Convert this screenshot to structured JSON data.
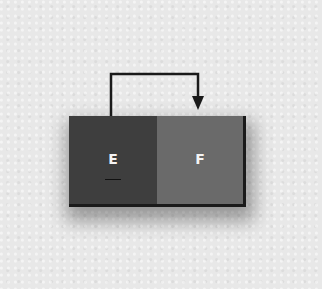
{
  "diagram": {
    "cells": [
      {
        "label": "E",
        "color": "#3e3e3e"
      },
      {
        "label": "F",
        "color": "#6a6a6a"
      }
    ],
    "arrow": {
      "from": "E",
      "to": "F",
      "color": "#1a1a1a"
    },
    "background": "#e8e8e8"
  }
}
